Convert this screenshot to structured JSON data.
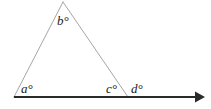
{
  "figure": {
    "type": "geometry-diagram",
    "width": 211,
    "height": 109,
    "background_color": "#ffffff"
  },
  "styles": {
    "triangle_stroke_color": "#a6a6a6",
    "triangle_stroke_width": 1,
    "baseline_stroke_color": "#2b2b2b",
    "baseline_stroke_width": 2.2,
    "label_color": "#1a1a1a"
  },
  "geometry": {
    "vertices": {
      "apex": {
        "name": "B",
        "x": 63,
        "y": 2
      },
      "base_left": {
        "name": "A",
        "x": 14,
        "y": 97
      },
      "base_right": {
        "name": "C",
        "x": 128,
        "y": 97
      }
    },
    "ray": {
      "name": "base-ray",
      "start_x": 14,
      "start_y": 97,
      "end_x": 205,
      "end_y": 97,
      "arrowhead": "right"
    },
    "segments": [
      {
        "name": "left-side",
        "from": "base_left",
        "to": "apex"
      },
      {
        "name": "right-side",
        "from": "apex",
        "to": "base_right"
      },
      {
        "name": "base",
        "from": "base_left",
        "to": "base_right"
      }
    ]
  },
  "labels": {
    "a": "a°",
    "b": "b°",
    "c": "c°",
    "d": "d°"
  }
}
